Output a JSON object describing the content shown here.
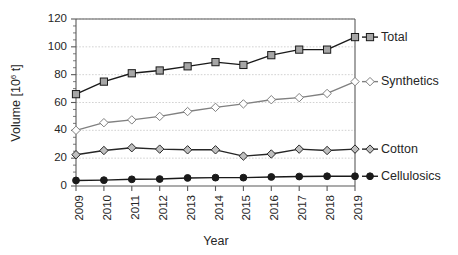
{
  "chart_data": {
    "type": "line",
    "title": "",
    "xlabel": "Year",
    "ylabel": "Volume [10^6 t]",
    "ylabel_base": "Volume [10",
    "ylabel_sup": "6",
    "ylabel_tail": " t]",
    "x": [
      2009,
      2010,
      2011,
      2012,
      2013,
      2014,
      2015,
      2016,
      2017,
      2018,
      2019
    ],
    "categories": [
      "2009",
      "2010",
      "2011",
      "2012",
      "2013",
      "2014",
      "2015",
      "2016",
      "2017",
      "2018",
      "2019"
    ],
    "ylim": [
      0,
      120
    ],
    "yticks": [
      0,
      20,
      40,
      60,
      80,
      100,
      120
    ],
    "ytick_labels": [
      "0",
      "20",
      "40",
      "60",
      "80",
      "100",
      "120"
    ],
    "y_minor_step": 5,
    "grid": true,
    "grid_axis": "y",
    "legend_position": "right-outside",
    "series": [
      {
        "name": "Total",
        "color": "#1a1a1a",
        "marker": "square",
        "marker_fill": "#a6a6a6",
        "values": [
          66,
          75,
          81,
          83,
          86,
          89,
          87,
          94,
          98,
          98,
          107
        ]
      },
      {
        "name": "Synthetics",
        "color": "#808080",
        "marker": "diamond",
        "marker_fill": "#ffffff",
        "values": [
          40,
          45.5,
          47.5,
          50,
          53.5,
          56.5,
          59,
          62,
          63.5,
          66.5,
          75
        ]
      },
      {
        "name": "Cotton",
        "color": "#262626",
        "marker": "diamond",
        "marker_fill": "#bfbfbf",
        "values": [
          22.5,
          25.5,
          27.5,
          26.5,
          26,
          26,
          21.5,
          23,
          26.5,
          25.5,
          26.5
        ]
      },
      {
        "name": "Cellulosics",
        "color": "#1a1a1a",
        "marker": "circle",
        "marker_fill": "#1a1a1a",
        "values": [
          4,
          4.2,
          4.8,
          5,
          5.8,
          6,
          6,
          6.5,
          6.8,
          7,
          7
        ]
      }
    ]
  },
  "legend": {
    "items": [
      {
        "label": "Total"
      },
      {
        "label": "Synthetics"
      },
      {
        "label": "Cotton"
      },
      {
        "label": "Cellulosics"
      }
    ]
  }
}
